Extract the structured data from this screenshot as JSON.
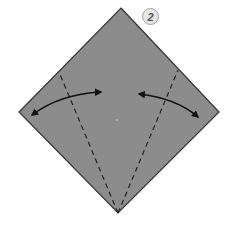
{
  "diagram": {
    "type": "origami-fold-instruction",
    "step_number": "2",
    "paper": {
      "shape": "square rotated 45deg (diamond)",
      "fill_color": "#8c8c8c",
      "edge_color": "#333333",
      "vertices": {
        "top": [
          121,
          8
        ],
        "right": [
          219,
          112
        ],
        "bottom": [
          118,
          213
        ],
        "left": [
          19,
          112
        ]
      }
    },
    "fold_lines": [
      {
        "name": "left-valley-fold",
        "style": "dashed",
        "from": [
          118,
          213
        ],
        "to": [
          59,
          72
        ]
      },
      {
        "name": "right-valley-fold",
        "style": "dashed",
        "from": [
          118,
          213
        ],
        "to": [
          178,
          70
        ]
      }
    ],
    "arrows": [
      {
        "name": "left-fold-arrow",
        "style": "double-headed curved",
        "from": [
          31,
          115
        ],
        "to": [
          102,
          92
        ]
      },
      {
        "name": "right-fold-arrow",
        "style": "double-headed curved",
        "from": [
          138,
          94
        ],
        "to": [
          199,
          118
        ]
      }
    ],
    "center_mark": [
      117,
      120
    ]
  }
}
